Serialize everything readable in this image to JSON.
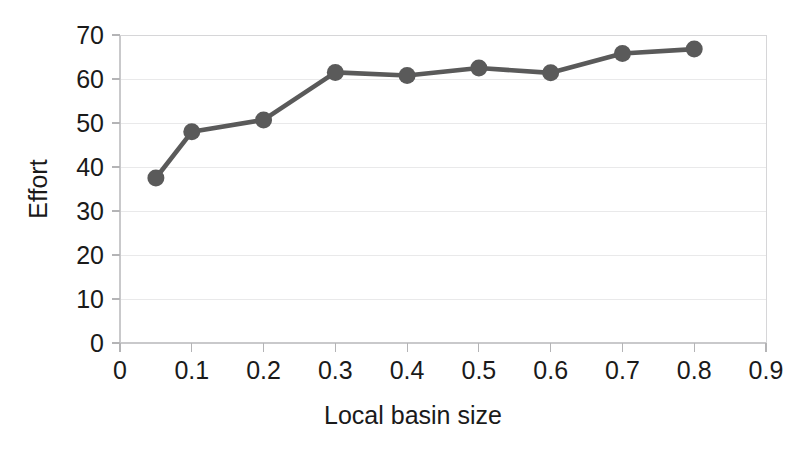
{
  "chart_data": {
    "type": "line",
    "title": "",
    "xlabel": "Local basin size",
    "ylabel": "Effort",
    "xlim": [
      0,
      0.9
    ],
    "ylim": [
      0,
      70
    ],
    "grid": true,
    "legend": "none",
    "series": [
      {
        "name": "Effort",
        "color": "#5a5a5a",
        "marker": "circle",
        "x": [
          0.05,
          0.1,
          0.2,
          0.3,
          0.4,
          0.5,
          0.6,
          0.7,
          0.8
        ],
        "values": [
          37.5,
          48.0,
          50.7,
          61.5,
          60.8,
          62.5,
          61.4,
          65.8,
          66.8
        ]
      }
    ],
    "x_ticks": [
      0,
      0.1,
      0.2,
      0.3,
      0.4,
      0.5,
      0.6,
      0.7,
      0.8,
      0.9
    ],
    "x_tick_labels": [
      "0",
      "0.1",
      "0.2",
      "0.3",
      "0.4",
      "0.5",
      "0.6",
      "0.7",
      "0.8",
      "0.9"
    ],
    "y_ticks": [
      0,
      10,
      20,
      30,
      40,
      50,
      60,
      70
    ],
    "y_tick_labels": [
      "0",
      "10",
      "20",
      "30",
      "40",
      "50",
      "60",
      "70"
    ]
  },
  "axes": {
    "y_axis_title": "Effort",
    "x_axis_title": "Local basin size"
  },
  "colors": {
    "series": "#5a5a5a",
    "grid": "#e9e9ea",
    "axis": "#c9c9cb",
    "text": "#1a1a1a",
    "background": "#ffffff"
  }
}
